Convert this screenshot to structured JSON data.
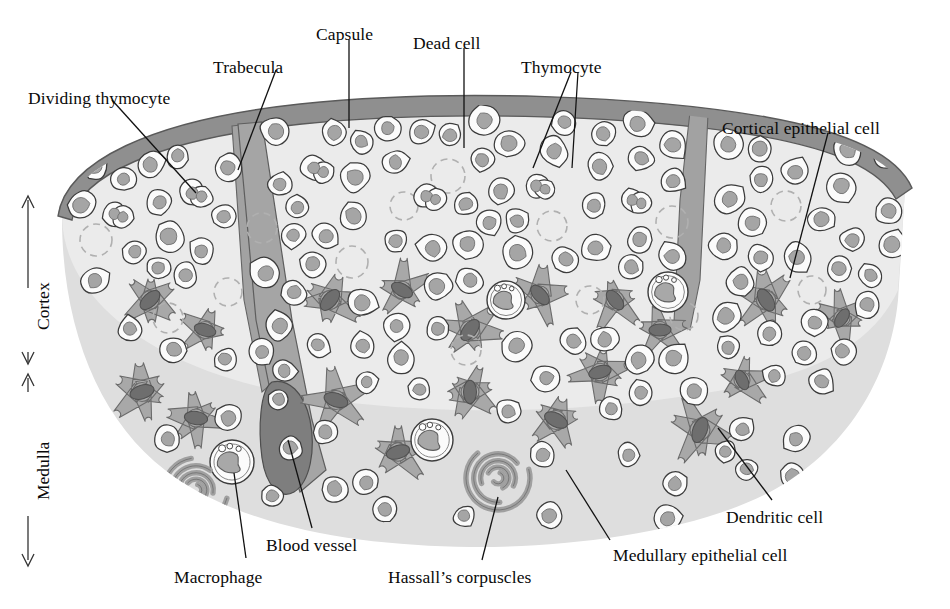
{
  "figure": {
    "background": "#ffffff"
  },
  "palette": {
    "capsule": "#8f8f8f",
    "capsule_stroke": "#5a5a5a",
    "cortex_fill": "#e8e8e8",
    "medulla_fill": "#dcdcdc",
    "trabecula": "#a2a2a2",
    "epithelial_body": "#a8a8a8",
    "epithelial_nucleus": "#6e6e6e",
    "thymocyte_cytoplasm": "#fbfbfb",
    "thymocyte_nucleus": "#a5a5a5",
    "dead_cell_stroke": "#b0b0b0",
    "blood_vessel": "#8a8a8a",
    "hassall_arc": "#a0a0a0",
    "outline": "#3c3c3c",
    "leader_line": "#111111",
    "label_text": "#0a0a0a"
  },
  "labels": [
    {
      "id": "dividing-thymocyte",
      "text": "Dividing thymocyte",
      "x": 28,
      "y": 88,
      "anchor": "left"
    },
    {
      "id": "trabecula",
      "text": "Trabecula",
      "x": 213,
      "y": 57,
      "anchor": "left"
    },
    {
      "id": "capsule",
      "text": "Capsule",
      "x": 316,
      "y": 24,
      "anchor": "left"
    },
    {
      "id": "dead-cell",
      "text": "Dead cell",
      "x": 413,
      "y": 33,
      "anchor": "left"
    },
    {
      "id": "thymocyte",
      "text": "Thymocyte",
      "x": 521,
      "y": 57,
      "anchor": "left"
    },
    {
      "id": "cortical-epithelial-cell",
      "text": "Cortical epithelial cell",
      "x": 722,
      "y": 118,
      "anchor": "left"
    },
    {
      "id": "dendritic-cell",
      "text": "Dendritic cell",
      "x": 726,
      "y": 507,
      "anchor": "left"
    },
    {
      "id": "medullary-epithelial-cell",
      "text": "Medullary epithelial cell",
      "x": 613,
      "y": 545,
      "anchor": "left"
    },
    {
      "id": "hassalls-corpuscles",
      "text": "Hassall’s corpuscles",
      "x": 388,
      "y": 567,
      "anchor": "left"
    },
    {
      "id": "macrophage",
      "text": "Macrophage",
      "x": 174,
      "y": 567,
      "anchor": "left"
    },
    {
      "id": "blood-vessel",
      "text": "Blood vessel",
      "x": 266,
      "y": 535,
      "anchor": "left"
    }
  ],
  "axis_labels": [
    {
      "id": "cortex",
      "text": "Cortex",
      "x": 33,
      "y": 330,
      "rotation": -90
    },
    {
      "id": "medulla",
      "text": "Medulla",
      "x": 33,
      "y": 500,
      "rotation": -90
    }
  ],
  "regions": [
    {
      "id": "cortex",
      "name": "Cortex",
      "description": "Outer densely packed thymocyte zone"
    },
    {
      "id": "medulla",
      "name": "Medulla",
      "description": "Inner lighter zone with Hassall's corpuscles"
    }
  ],
  "cell_types": [
    {
      "id": "thymocyte",
      "name": "Thymocyte",
      "count_approx": 150
    },
    {
      "id": "dividing-thymocyte",
      "name": "Dividing thymocyte",
      "count_approx": 6
    },
    {
      "id": "dead-cell",
      "name": "Dead cell",
      "count_approx": 14
    },
    {
      "id": "cortical-epithelial-cell",
      "name": "Cortical epithelial cell",
      "count_approx": 9
    },
    {
      "id": "medullary-epithelial-cell",
      "name": "Medullary epithelial cell",
      "count_approx": 8
    },
    {
      "id": "dendritic-cell",
      "name": "Dendritic cell",
      "count_approx": 3
    },
    {
      "id": "macrophage",
      "name": "Macrophage",
      "count_approx": 5
    },
    {
      "id": "hassalls-corpuscle",
      "name": "Hassall's corpuscle",
      "count_approx": 2
    },
    {
      "id": "blood-vessel",
      "name": "Blood vessel",
      "count_approx": 1
    },
    {
      "id": "trabecula",
      "name": "Trabecula",
      "count_approx": 4
    },
    {
      "id": "capsule",
      "name": "Capsule",
      "count_approx": 1
    }
  ]
}
